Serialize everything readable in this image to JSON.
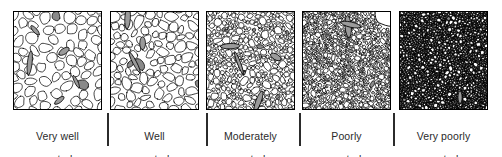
{
  "figure": {
    "background_color": "#ffffff",
    "stroke_color": "#000000",
    "separator_color": "#2b2b2b",
    "caption_color": "#2a2a2a"
  },
  "panels": [
    {
      "id": "very-well-sorted",
      "caption_line1": "Very well",
      "caption_line2": "sorted",
      "sorting_class": "Very well sorted",
      "grain_uniformity": "uniform",
      "grain_size_range_px": [
        5.5,
        9.0
      ],
      "fill_darkness": "light",
      "x": 13
    },
    {
      "id": "well-sorted",
      "caption_line1": "Well",
      "caption_line2": "sorted",
      "sorting_class": "Well sorted",
      "grain_uniformity": "mostly uniform",
      "grain_size_range_px": [
        4.0,
        10.5
      ],
      "fill_darkness": "light",
      "x": 110
    },
    {
      "id": "moderately-sorted",
      "caption_line1": "Moderately",
      "caption_line2": "sorted",
      "sorting_class": "Moderately sorted",
      "grain_uniformity": "mixed",
      "grain_size_range_px": [
        2.6,
        20.0
      ],
      "fill_darkness": "medium",
      "x": 206
    },
    {
      "id": "poorly-sorted",
      "caption_line1": "Poorly",
      "caption_line2": "sorted",
      "sorting_class": "Poorly sorted",
      "grain_uniformity": "varied",
      "grain_size_range_px": [
        1.9,
        34.0
      ],
      "fill_darkness": "dark",
      "x": 302
    },
    {
      "id": "very-poorly-sorted",
      "caption_line1": "Very poorly",
      "caption_line2": "sorted",
      "sorting_class": "Very poorly sorted",
      "grain_uniformity": "highly varied",
      "grain_size_range_px": [
        1.4,
        40.0
      ],
      "fill_darkness": "very dark",
      "x": 399
    }
  ],
  "separators": {
    "count": 4,
    "x_positions": [
      107,
      206,
      299,
      393
    ]
  },
  "chart_data": {
    "type": "diagram",
    "categories": [
      "Very well sorted",
      "Well sorted",
      "Moderately sorted",
      "Poorly sorted",
      "Very poorly sorted"
    ],
    "series": [
      {
        "name": "Grain size variability (relative)",
        "values": [
          1,
          2,
          3,
          4,
          5
        ]
      }
    ],
    "xlabel": "",
    "ylabel": "",
    "legend": [],
    "grid": false
  }
}
